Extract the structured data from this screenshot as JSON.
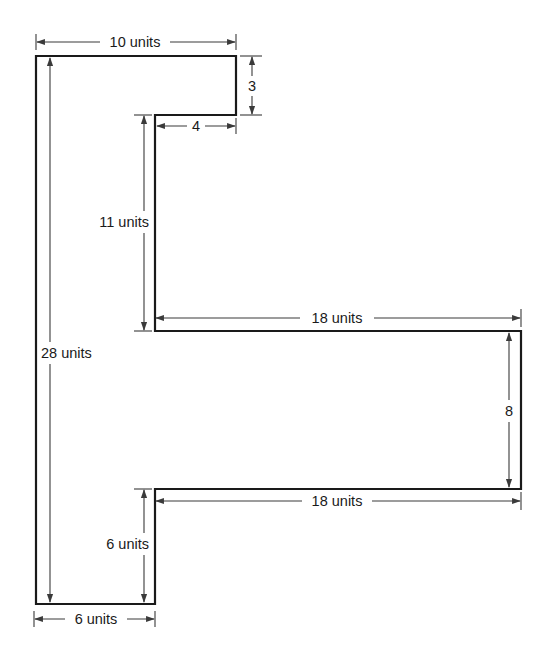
{
  "diagram": {
    "type": "dimensioned-polygon",
    "colors": {
      "line": "#1a1a1a",
      "dimension": "#3a3a3a",
      "background": "#ffffff"
    },
    "dimensions": {
      "top_width": "10 units",
      "top_tab_height": "3",
      "notch_width": "4",
      "upper_inner_height": "11 units",
      "total_height": "28 units",
      "flange_top_length": "18 units",
      "flange_height": "8",
      "flange_bottom_length": "18 units",
      "lower_inner_height": "6 units",
      "base_width": "6 units"
    }
  }
}
